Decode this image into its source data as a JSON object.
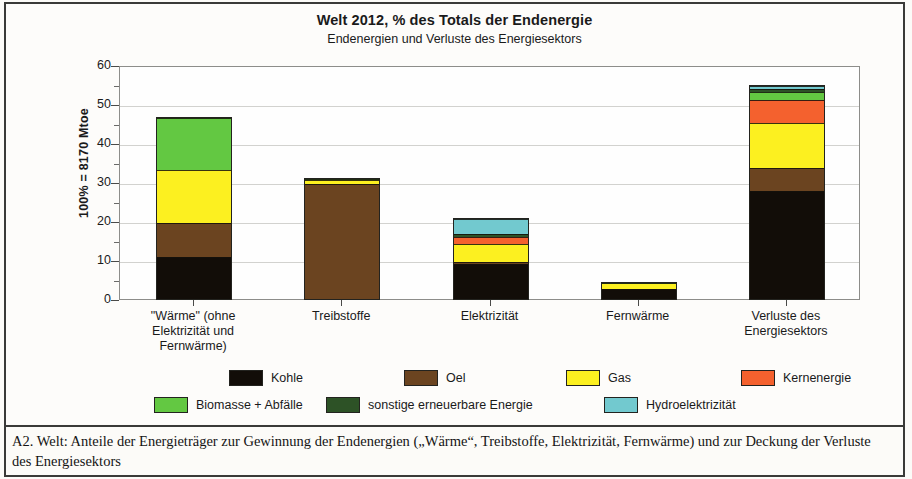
{
  "figure": {
    "title": "Welt 2012,  % des Totals der Endenergie",
    "subtitle": "Endenergien und Verluste des Energiesektors",
    "caption": "A2. Welt: Anteile der Energieträger zur Gewinnung der Endenergien („Wärme“, Treibstoffe, Elektrizität, Fernwärme) und zur Deckung der Verluste des Energiesektors"
  },
  "colors": {
    "kohle": "#120d08",
    "oel": "#6b4420",
    "gas": "#fcf020",
    "kernenergie": "#f4612e",
    "biomasse": "#63c842",
    "sonstige": "#2d5226",
    "hydro": "#72c9cf",
    "grid": "#d2d2cf",
    "axis": "#5a5a58"
  },
  "chart_data": {
    "type": "bar",
    "stacked": true,
    "title": "Welt 2012,  % des Totals der Endenergie",
    "subtitle": "Endenergien und Verluste des Energiesektors",
    "xlabel": "",
    "ylabel": "100% = 8170 Mtoe",
    "ylim": [
      0,
      60
    ],
    "yticks": [
      0,
      10,
      20,
      30,
      40,
      50,
      60
    ],
    "ytick_labels": [
      "0",
      "10",
      "20",
      "30",
      "40",
      "50",
      "60"
    ],
    "yminor_ticks": [
      5,
      15,
      25,
      35,
      45,
      55
    ],
    "grid": true,
    "legend_position": "bottom",
    "categories": [
      "\"Wärme\" (ohne Elektrizität und Fernwärme)",
      "Treibstoffe",
      "Elektrizität",
      "Fernwärme",
      "Verluste des Energiesektors"
    ],
    "category_lines": [
      [
        "\"Wärme\" (ohne",
        "Elektrizität und",
        "Fernwärme)"
      ],
      [
        "Treibstoffe"
      ],
      [
        "Elektrizität"
      ],
      [
        "Fernwärme"
      ],
      [
        "Verluste des",
        "Energiesektors"
      ]
    ],
    "series": [
      {
        "name": "Kohle",
        "color": "#120d08",
        "values": [
          10.7,
          0.0,
          8.9,
          2.5,
          27.8
        ]
      },
      {
        "name": "Oel",
        "color": "#6b4420",
        "values": [
          8.8,
          29.6,
          0.7,
          0.0,
          5.9
        ]
      },
      {
        "name": "Gas",
        "color": "#fcf020",
        "values": [
          13.5,
          0.8,
          4.6,
          1.5,
          11.5
        ]
      },
      {
        "name": "Kernenergie",
        "color": "#f4612e",
        "values": [
          0.0,
          0.0,
          1.7,
          0.0,
          5.8
        ]
      },
      {
        "name": "Biomasse + Abfälle",
        "color": "#63c842",
        "values": [
          13.3,
          0.5,
          0.0,
          0.1,
          2.0
        ]
      },
      {
        "name": "sonstige erneuerbare Energie",
        "color": "#2d5226",
        "values": [
          0.0,
          0.0,
          0.7,
          0.0,
          0.8
        ]
      },
      {
        "name": "Hydroelektrizität",
        "color": "#72c9cf",
        "values": [
          0.0,
          0.0,
          3.8,
          0.0,
          0.8
        ]
      }
    ],
    "totals": [
      46.3,
      30.9,
      20.4,
      4.1,
      54.6
    ]
  },
  "legend": {
    "rows": [
      [
        {
          "label": "Kohle",
          "color": "#120d08"
        },
        {
          "label": "Oel",
          "color": "#6b4420"
        },
        {
          "label": "Gas",
          "color": "#fcf020"
        },
        {
          "label": "Kernenergie",
          "color": "#f4612e"
        }
      ],
      [
        {
          "label": "Biomasse + Abfälle",
          "color": "#63c842"
        },
        {
          "label": "sonstige erneuerbare Energie",
          "color": "#2d5226"
        },
        {
          "label": "Hydroelektrizität",
          "color": "#72c9cf"
        }
      ]
    ]
  }
}
